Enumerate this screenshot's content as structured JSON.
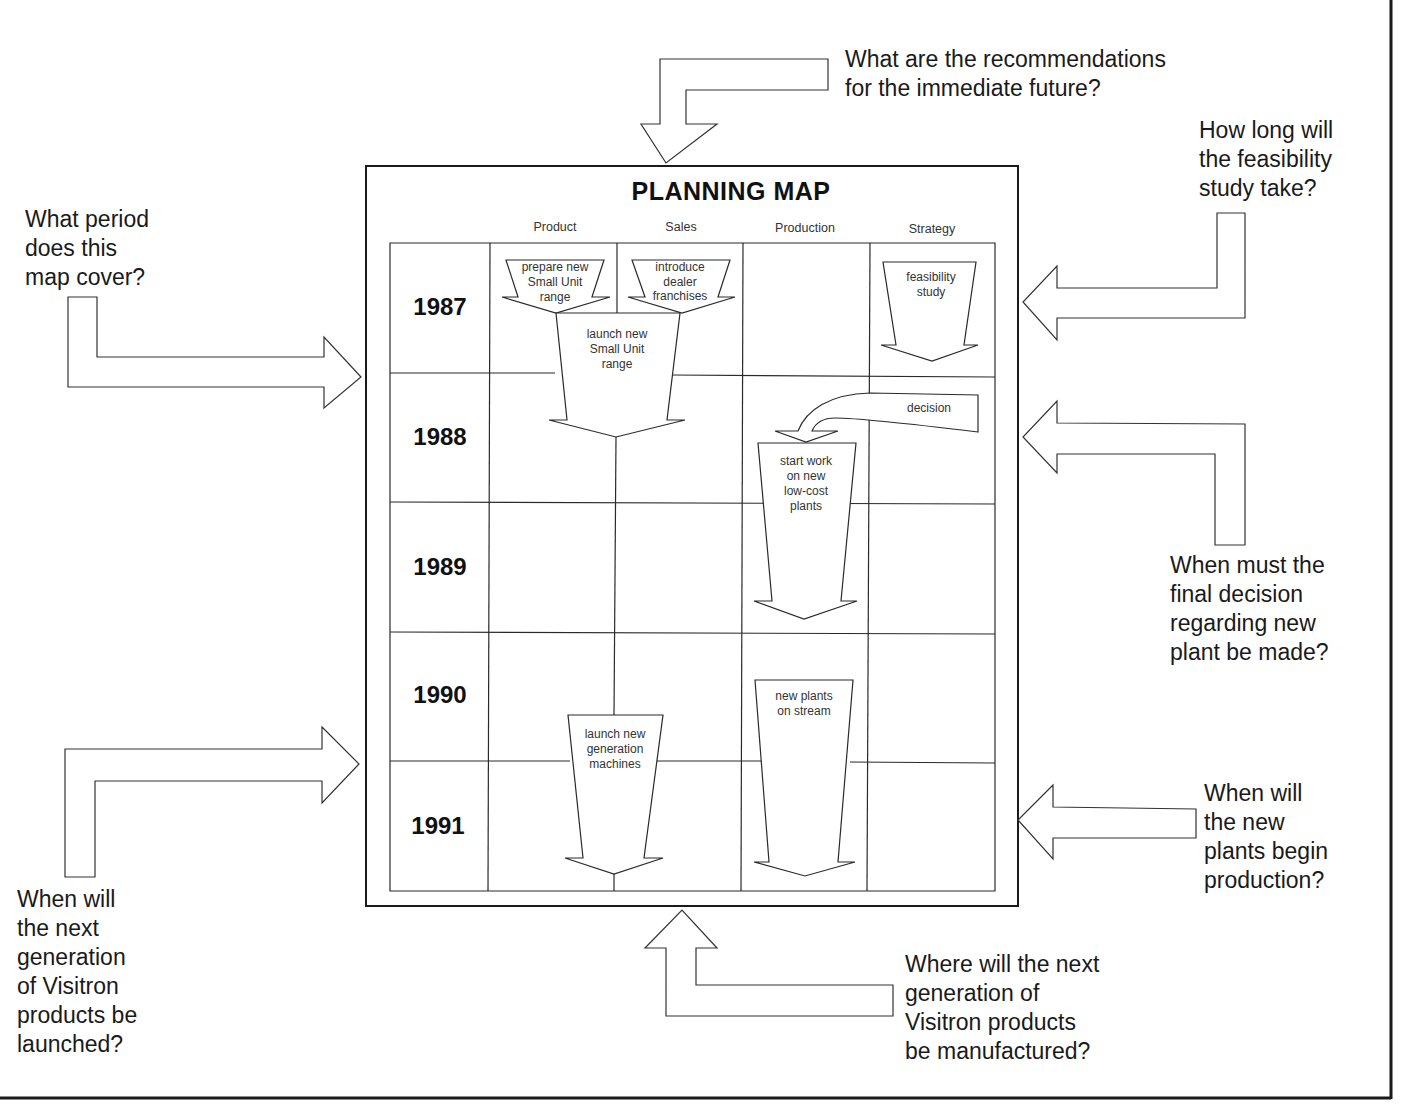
{
  "planning_map": {
    "title": "PLANNING MAP",
    "columns": [
      "Product",
      "Sales",
      "Production",
      "Strategy"
    ],
    "years": [
      "1987",
      "1988",
      "1989",
      "1990",
      "1991"
    ],
    "activities": {
      "prepare_small_unit": "prepare new\nSmall Unit\nrange",
      "dealer_franchises": "introduce\ndealer\nfranchises",
      "launch_small_unit": "launch new\nSmall Unit\nrange",
      "feasibility_study": "feasibility\nstudy",
      "decision": "decision",
      "start_work_plants": "start work\non new\nlow-cost\nplants",
      "new_plants_on_stream": "new plants\non stream",
      "launch_new_generation": "launch new\ngeneration\nmachines"
    }
  },
  "questions": {
    "recommendations": "What are the recommendations\nfor the immediate future?",
    "feasibility_duration": "How long will\nthe feasibility\nstudy take?",
    "period_covered": "What period\ndoes this\nmap cover?",
    "final_decision": "When must the\nfinal decision\nregarding new\nplant be made?",
    "next_generation_launch": "When will\nthe next\ngeneration\nof Visitron\nproducts be\nlaunched?",
    "plants_production": "When will\nthe new\nplants begin\nproduction?",
    "manufacture_location": "Where will the next\ngeneration of\nVisitron products\nbe manufactured?"
  },
  "colors": {
    "ink": "#1a1a1a",
    "paper": "#ffffff"
  }
}
